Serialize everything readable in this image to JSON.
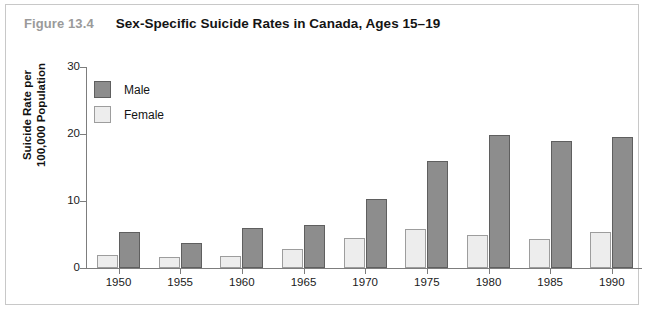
{
  "figure": {
    "number": "Figure 13.4",
    "title": "Sex-Specific Suicide Rates in Canada, Ages 15–19"
  },
  "legend": {
    "position": "top-left",
    "entries": [
      {
        "label": "Male",
        "color": "#8d8d8d"
      },
      {
        "label": "Female",
        "color": "#ededed"
      }
    ]
  },
  "axes": {
    "y_title_line1": "Suicide Rate per",
    "y_title_line2": "100,000 Population",
    "y_ticks": [
      "0",
      "10",
      "20",
      "30"
    ],
    "x_ticks": [
      "1950",
      "1955",
      "1960",
      "1965",
      "1970",
      "1975",
      "1980",
      "1985",
      "1990"
    ]
  },
  "chart_data": {
    "type": "bar",
    "title": "Sex-Specific Suicide Rates in Canada, Ages 15–19",
    "xlabel": "",
    "ylabel": "Suicide Rate per 100,000 Population",
    "categories": [
      "1950",
      "1955",
      "1960",
      "1965",
      "1970",
      "1975",
      "1980",
      "1985",
      "1990"
    ],
    "series": [
      {
        "name": "Female",
        "color": "#ededed",
        "values": [
          2.0,
          1.6,
          1.8,
          2.9,
          4.5,
          5.8,
          5.0,
          4.3,
          5.4
        ]
      },
      {
        "name": "Male",
        "color": "#8d8d8d",
        "values": [
          5.4,
          3.7,
          6.0,
          6.4,
          10.3,
          16.0,
          19.8,
          18.9,
          19.5
        ]
      }
    ],
    "ylim": [
      0,
      30
    ],
    "yticks": [
      0,
      10,
      20,
      30
    ],
    "grid": false,
    "legend_position": "top-left"
  }
}
